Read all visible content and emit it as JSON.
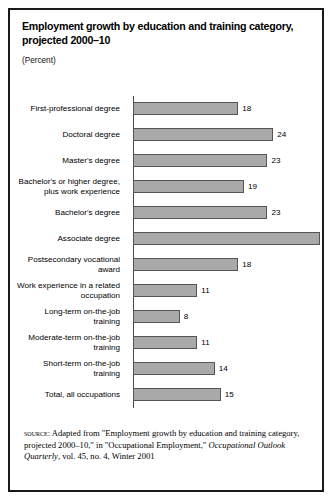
{
  "figure": {
    "title": "Employment growth by education and training category, projected 2000–10",
    "subtitle": "(Percent)",
    "source_label": "source:",
    "source_text_1": " Adapted from \"Employment growth by education and training category, projected 2000–10,\" in \"Occupational Employment,\" ",
    "source_italic": "Occupational Outlook Quarterly",
    "source_text_2": ", vol. 45, no. 4, Winter 2001"
  },
  "chart_data": {
    "type": "bar",
    "orientation": "horizontal",
    "title": "Employment growth by education and training category, projected 2000–10",
    "subtitle": "(Percent)",
    "xlabel": "Percent",
    "ylabel": "",
    "xlim": [
      0,
      32
    ],
    "grid": false,
    "legend": "none",
    "bar_color": "#a9a9a9",
    "bar_border_color": "#555555",
    "axis_color": "#4a4a4a",
    "categories": [
      "First-professional degree",
      "Doctoral degree",
      "Master's degree",
      "Bachelor's or higher degree, plus work experience",
      "Bachelor's degree",
      "Associate degree",
      "Postsecondary vocational award",
      "Work experience in a related occupation",
      "Long-term on-the-job training",
      "Moderate-term on-the-job training",
      "Short-term on-the-job training",
      "Total, all occupations"
    ],
    "values": [
      18,
      24,
      23,
      19,
      23,
      32,
      18,
      11,
      8,
      11,
      14,
      15
    ]
  },
  "rows": [
    {
      "label_lines": [
        "First-professional degree"
      ],
      "value": 18
    },
    {
      "label_lines": [
        "Doctoral degree"
      ],
      "value": 24
    },
    {
      "label_lines": [
        "Master's degree"
      ],
      "value": 23
    },
    {
      "label_lines": [
        "Bachelor's or higher degree,",
        "plus work experience"
      ],
      "value": 19
    },
    {
      "label_lines": [
        "Bachelor's degree"
      ],
      "value": 23
    },
    {
      "label_lines": [
        "Associate degree"
      ],
      "value": 32
    },
    {
      "label_lines": [
        "Postsecondary vocational",
        "award"
      ],
      "value": 18
    },
    {
      "label_lines": [
        "Work experience in a related",
        "occupation"
      ],
      "value": 11
    },
    {
      "label_lines": [
        "Long-term on-the-job",
        "training"
      ],
      "value": 8
    },
    {
      "label_lines": [
        "Moderate-term on-the-job",
        "training"
      ],
      "value": 11
    },
    {
      "label_lines": [
        "Short-term on-the-job",
        "training"
      ],
      "value": 14
    },
    {
      "label_lines": [
        "Total, all occupations"
      ],
      "value": 15
    }
  ]
}
